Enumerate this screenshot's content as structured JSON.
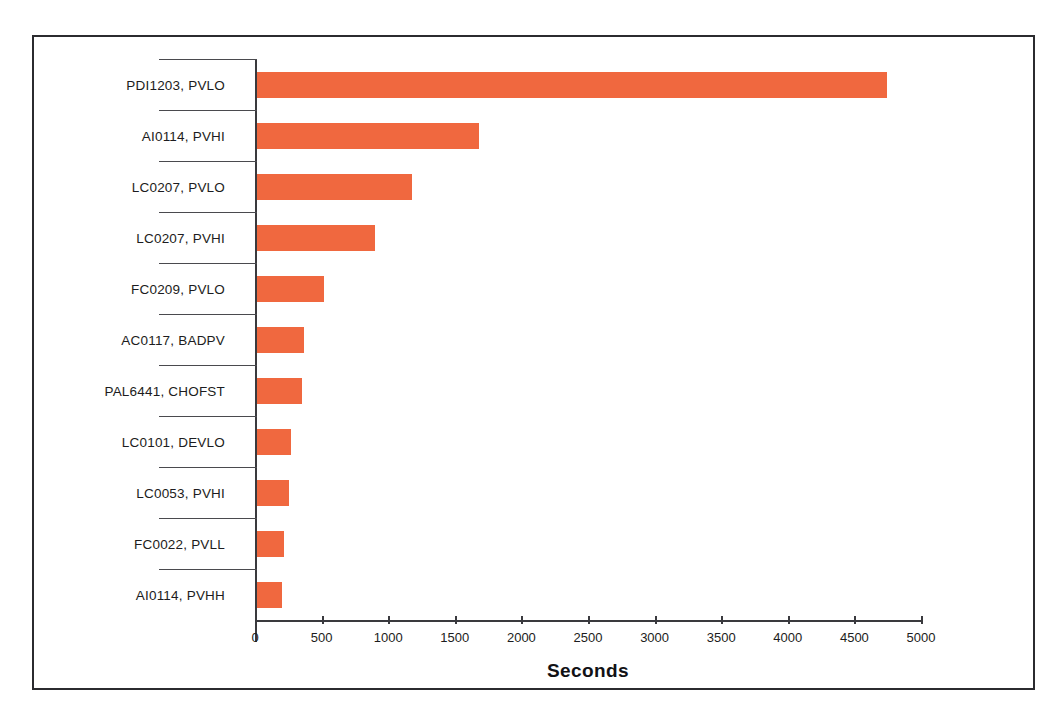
{
  "chart_data": {
    "type": "bar",
    "orientation": "horizontal",
    "title": "",
    "xlabel": "Seconds",
    "ylabel": "",
    "xlim": [
      0,
      5000
    ],
    "xticks": [
      0,
      500,
      1000,
      1500,
      2000,
      2500,
      3000,
      3500,
      4000,
      4500,
      5000
    ],
    "grid": false,
    "legend": false,
    "bar_color": "#f0683f",
    "categories": [
      "PDI1203, PVLO",
      "AI0114, PVHI",
      "LC0207, PVLO",
      "LC0207, PVHI",
      "FC0209, PVLO",
      "AC0117, BADPV",
      "PAL6441, CHOFST",
      "LC0101, DEVLO",
      "LC0053, PVHI",
      "FC0022, PVLL",
      "AI0114, PVHH"
    ],
    "values": [
      4730,
      1665,
      1165,
      885,
      505,
      355,
      340,
      255,
      240,
      200,
      190
    ]
  },
  "axis": {
    "x_title": "Seconds"
  }
}
